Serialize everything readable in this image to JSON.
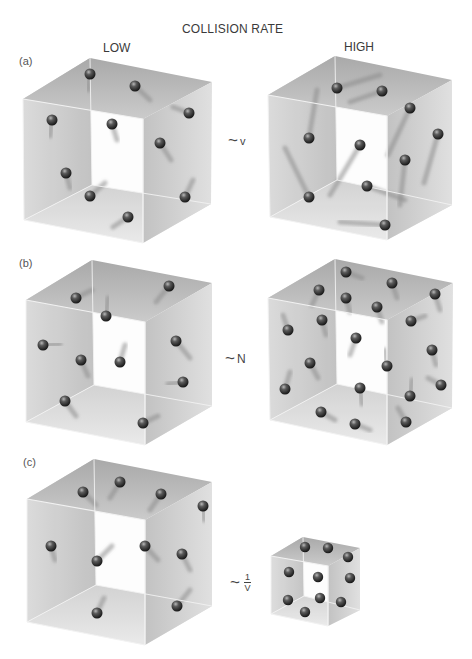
{
  "title": "COLLISION RATE",
  "columns": {
    "low": "LOW",
    "high": "HIGH"
  },
  "colors": {
    "face_left": "#c9c9c9",
    "face_back": "#fbfbfb",
    "face_right": "#cfcfcf",
    "face_top": "#bdbdbd",
    "face_bottom": "#dedede",
    "edge": "#f2f2f2",
    "ball_dark": "#1e1e1e",
    "ball_light": "#9a9a9a",
    "trail": "#8a8a8a"
  },
  "rows": [
    {
      "panel": "(a)",
      "relation": {
        "symbol": "~",
        "var": "v",
        "fraction": null
      },
      "low": {
        "cube": {
          "btl": [
            90,
            58
          ],
          "btr": [
            212,
            82
          ],
          "ftl": [
            23,
            99
          ],
          "ftr": [
            143,
            119
          ],
          "fbl": [
            24,
            220
          ],
          "fbr": [
            143,
            243
          ],
          "bbr": [
            211,
            204
          ],
          "bbl": [
            92,
            185
          ]
        },
        "balls": [
          {
            "x": 90,
            "y": 74,
            "tx": 88,
            "ty": 90
          },
          {
            "x": 135,
            "y": 86,
            "tx": 150,
            "ty": 100
          },
          {
            "x": 189,
            "y": 113,
            "tx": 173,
            "ty": 107
          },
          {
            "x": 52,
            "y": 120,
            "tx": 50,
            "ty": 136
          },
          {
            "x": 112,
            "y": 124,
            "tx": 117,
            "ty": 140
          },
          {
            "x": 160,
            "y": 143,
            "tx": 171,
            "ty": 160
          },
          {
            "x": 66,
            "y": 173,
            "tx": 70,
            "ty": 188
          },
          {
            "x": 90,
            "y": 196,
            "tx": 105,
            "ty": 183
          },
          {
            "x": 185,
            "y": 197,
            "tx": 193,
            "ty": 180
          },
          {
            "x": 128,
            "y": 217,
            "tx": 113,
            "ty": 227
          }
        ]
      },
      "high": {
        "cube": {
          "btl": [
            335,
            56
          ],
          "btr": [
            452,
            80
          ],
          "ftl": [
            268,
            95
          ],
          "ftr": [
            387,
            116
          ],
          "fbl": [
            270,
            217
          ],
          "fbr": [
            387,
            240
          ],
          "bbr": [
            452,
            205
          ],
          "bbl": [
            337,
            180
          ]
        },
        "balls": [
          {
            "x": 337,
            "y": 88,
            "tx": 380,
            "ty": 75
          },
          {
            "x": 382,
            "y": 91,
            "tx": 350,
            "ty": 102
          },
          {
            "x": 410,
            "y": 108,
            "tx": 388,
            "ty": 155
          },
          {
            "x": 309,
            "y": 138,
            "tx": 317,
            "ty": 90
          },
          {
            "x": 360,
            "y": 145,
            "tx": 330,
            "ty": 195
          },
          {
            "x": 438,
            "y": 134,
            "tx": 424,
            "ty": 183
          },
          {
            "x": 405,
            "y": 160,
            "tx": 400,
            "ty": 205
          },
          {
            "x": 367,
            "y": 186,
            "tx": 405,
            "ty": 200
          },
          {
            "x": 309,
            "y": 197,
            "tx": 285,
            "ty": 148
          },
          {
            "x": 385,
            "y": 225,
            "tx": 340,
            "ty": 222
          }
        ]
      }
    },
    {
      "panel": "(b)",
      "relation": {
        "symbol": "~",
        "var": "N",
        "fraction": null
      },
      "low": {
        "cube": {
          "btl": [
            92,
            260
          ],
          "btr": [
            212,
            283
          ],
          "ftl": [
            26,
            300
          ],
          "ftr": [
            145,
            322
          ],
          "fbl": [
            26,
            422
          ],
          "fbr": [
            145,
            445
          ],
          "bbr": [
            212,
            406
          ],
          "bbl": [
            94,
            385
          ]
        },
        "balls": [
          {
            "x": 76,
            "y": 298,
            "tx": 92,
            "ty": 290
          },
          {
            "x": 169,
            "y": 286,
            "tx": 156,
            "ty": 302
          },
          {
            "x": 106,
            "y": 316,
            "tx": 108,
            "ty": 298
          },
          {
            "x": 43,
            "y": 345,
            "tx": 60,
            "ty": 344
          },
          {
            "x": 81,
            "y": 360,
            "tx": 88,
            "ty": 376
          },
          {
            "x": 120,
            "y": 362,
            "tx": 125,
            "ty": 345
          },
          {
            "x": 176,
            "y": 341,
            "tx": 190,
            "ty": 358
          },
          {
            "x": 183,
            "y": 382,
            "tx": 168,
            "ty": 384
          },
          {
            "x": 65,
            "y": 401,
            "tx": 76,
            "ty": 416
          },
          {
            "x": 143,
            "y": 423,
            "tx": 158,
            "ty": 416
          }
        ]
      },
      "high": {
        "cube": {
          "btl": [
            335,
            259
          ],
          "btr": [
            453,
            283
          ],
          "ftl": [
            268,
            298
          ],
          "ftr": [
            387,
            320
          ],
          "fbl": [
            270,
            420
          ],
          "fbr": [
            387,
            445
          ],
          "bbr": [
            452,
            408
          ],
          "bbl": [
            337,
            384
          ]
        },
        "balls": [
          {
            "x": 346,
            "y": 272,
            "tx": 362,
            "ty": 278
          },
          {
            "x": 392,
            "y": 283,
            "tx": 397,
            "ty": 298
          },
          {
            "x": 435,
            "y": 294,
            "tx": 440,
            "ty": 310
          },
          {
            "x": 319,
            "y": 290,
            "tx": 312,
            "ty": 305
          },
          {
            "x": 346,
            "y": 298,
            "tx": 350,
            "ty": 312
          },
          {
            "x": 377,
            "y": 307,
            "tx": 382,
            "ty": 322
          },
          {
            "x": 322,
            "y": 320,
            "tx": 326,
            "ty": 335
          },
          {
            "x": 411,
            "y": 321,
            "tx": 425,
            "ty": 316
          },
          {
            "x": 288,
            "y": 330,
            "tx": 283,
            "ty": 315
          },
          {
            "x": 356,
            "y": 338,
            "tx": 350,
            "ty": 355
          },
          {
            "x": 432,
            "y": 350,
            "tx": 436,
            "ty": 365
          },
          {
            "x": 310,
            "y": 363,
            "tx": 318,
            "ty": 378
          },
          {
            "x": 387,
            "y": 366,
            "tx": 385,
            "ty": 350
          },
          {
            "x": 285,
            "y": 389,
            "tx": 290,
            "ty": 372
          },
          {
            "x": 360,
            "y": 388,
            "tx": 362,
            "ty": 404
          },
          {
            "x": 441,
            "y": 385,
            "tx": 428,
            "ty": 378
          },
          {
            "x": 410,
            "y": 396,
            "tx": 412,
            "ty": 380
          },
          {
            "x": 321,
            "y": 412,
            "tx": 335,
            "ty": 420
          },
          {
            "x": 355,
            "y": 424,
            "tx": 370,
            "ty": 430
          },
          {
            "x": 406,
            "y": 422,
            "tx": 398,
            "ty": 408
          }
        ]
      }
    },
    {
      "panel": "(c)",
      "relation": {
        "symbol": "~",
        "var": "",
        "fraction": {
          "num": "1",
          "den": "V"
        }
      },
      "low": {
        "cube": {
          "btl": [
            94,
            459
          ],
          "btr": [
            212,
            482
          ],
          "ftl": [
            27,
            499
          ],
          "ftr": [
            145,
            520
          ],
          "fbl": [
            27,
            622
          ],
          "fbr": [
            145,
            645
          ],
          "bbr": [
            212,
            606
          ],
          "bbl": [
            96,
            585
          ]
        },
        "balls": [
          {
            "x": 120,
            "y": 482,
            "tx": 110,
            "ty": 498
          },
          {
            "x": 83,
            "y": 492,
            "tx": 96,
            "ty": 505
          },
          {
            "x": 161,
            "y": 494,
            "tx": 150,
            "ty": 510
          },
          {
            "x": 203,
            "y": 506,
            "tx": 204,
            "ty": 520
          },
          {
            "x": 51,
            "y": 546,
            "tx": 55,
            "ty": 560
          },
          {
            "x": 145,
            "y": 546,
            "tx": 158,
            "ty": 560
          },
          {
            "x": 182,
            "y": 554,
            "tx": 190,
            "ty": 570
          },
          {
            "x": 97,
            "y": 561,
            "tx": 112,
            "ty": 546
          },
          {
            "x": 97,
            "y": 613,
            "tx": 104,
            "ty": 598
          },
          {
            "x": 177,
            "y": 606,
            "tx": 190,
            "ty": 590
          }
        ]
      },
      "high": {
        "cube": {
          "btl": [
            303,
            537
          ],
          "btr": [
            360,
            548
          ],
          "ftl": [
            271,
            556
          ],
          "ftr": [
            328,
            566
          ],
          "fbl": [
            271,
            614
          ],
          "fbr": [
            328,
            626
          ],
          "bbr": [
            360,
            610
          ],
          "bbl": [
            304,
            596
          ]
        },
        "balls": [
          {
            "x": 305,
            "y": 547,
            "tx": 0,
            "ty": 0
          },
          {
            "x": 328,
            "y": 548,
            "tx": 0,
            "ty": 0
          },
          {
            "x": 348,
            "y": 557,
            "tx": 0,
            "ty": 0
          },
          {
            "x": 289,
            "y": 572,
            "tx": 0,
            "ty": 0
          },
          {
            "x": 318,
            "y": 577,
            "tx": 0,
            "ty": 0
          },
          {
            "x": 350,
            "y": 578,
            "tx": 0,
            "ty": 0
          },
          {
            "x": 288,
            "y": 600,
            "tx": 0,
            "ty": 0
          },
          {
            "x": 320,
            "y": 598,
            "tx": 0,
            "ty": 0
          },
          {
            "x": 341,
            "y": 602,
            "tx": 0,
            "ty": 0
          },
          {
            "x": 305,
            "y": 612,
            "tx": 0,
            "ty": 0
          }
        ]
      }
    }
  ]
}
